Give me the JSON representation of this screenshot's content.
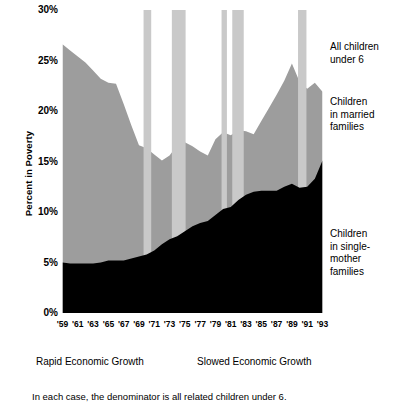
{
  "chart_data": {
    "type": "area",
    "title": "",
    "subtitle": "",
    "xlabel": "",
    "ylabel": "Percent in Poverty",
    "xlim": [
      1959,
      1993
    ],
    "ylim": [
      0,
      30
    ],
    "grid": false,
    "legend_position": "right-annotations",
    "y_ticks": [
      "30%",
      "25%",
      "20%",
      "15%",
      "10%",
      "5%",
      "0%"
    ],
    "y_tick_values": [
      30,
      25,
      20,
      15,
      10,
      5,
      0
    ],
    "x_ticks": [
      "'59",
      "'61",
      "'63",
      "'65",
      "'67",
      "'69",
      "'71",
      "'73",
      "'75",
      "'77",
      "'79",
      "'81",
      "'83",
      "'85",
      "'87",
      "'89",
      "'91",
      "'93"
    ],
    "x_tick_values": [
      1959,
      1961,
      1963,
      1965,
      1967,
      1969,
      1971,
      1973,
      1975,
      1977,
      1979,
      1981,
      1983,
      1985,
      1987,
      1989,
      1991,
      1993
    ],
    "x_minor_ticks": [
      1960,
      1962,
      1964,
      1966,
      1968,
      1970,
      1972,
      1974,
      1976,
      1978,
      1980,
      1982,
      1984,
      1986,
      1988,
      1990,
      1992
    ],
    "years": [
      1959,
      1960,
      1961,
      1962,
      1963,
      1964,
      1965,
      1966,
      1967,
      1968,
      1969,
      1970,
      1971,
      1972,
      1973,
      1974,
      1975,
      1976,
      1977,
      1978,
      1979,
      1980,
      1981,
      1982,
      1983,
      1984,
      1985,
      1986,
      1987,
      1988,
      1989,
      1990,
      1991,
      1992,
      1993
    ],
    "series": [
      {
        "name": "All children under 6",
        "stack_role": "total-upper-boundary",
        "fill": "#000000",
        "line_style": "thick-black",
        "values": [
          26.6,
          26.0,
          25.4,
          24.8,
          24.0,
          23.2,
          22.8,
          22.7,
          20.7,
          18.6,
          16.6,
          16.3,
          15.7,
          15.1,
          15.6,
          16.6,
          16.9,
          16.5,
          16.0,
          15.6,
          17.2,
          17.9,
          17.6,
          18.1,
          18.0,
          17.7,
          19.0,
          20.3,
          21.6,
          23.0,
          24.7,
          22.9,
          22.2,
          22.8,
          21.9
        ]
      },
      {
        "name": "Children in married families",
        "stack_role": "middle-band",
        "fill": "#9d9d9d",
        "values": [
          21.6,
          21.1,
          20.5,
          19.9,
          19.1,
          18.2,
          17.6,
          17.5,
          15.5,
          13.2,
          11.0,
          10.5,
          9.5,
          8.3,
          8.3,
          9.0,
          8.8,
          7.9,
          7.1,
          6.5,
          7.5,
          7.6,
          7.1,
          6.9,
          6.3,
          5.7,
          6.9,
          8.2,
          9.5,
          10.5,
          11.9,
          10.5,
          9.7,
          9.5,
          6.8
        ]
      },
      {
        "name": "Children in single-mother families",
        "stack_role": "bottom-band",
        "fill": "#000000",
        "values": [
          5.0,
          4.9,
          4.9,
          4.9,
          4.9,
          5.0,
          5.2,
          5.2,
          5.2,
          5.4,
          5.6,
          5.8,
          6.2,
          6.8,
          7.3,
          7.6,
          8.1,
          8.6,
          8.9,
          9.1,
          9.7,
          10.3,
          10.5,
          11.2,
          11.7,
          12.0,
          12.1,
          12.1,
          12.1,
          12.5,
          12.8,
          12.4,
          12.5,
          13.3,
          15.1
        ]
      }
    ],
    "recession_bands": [
      {
        "label": "1969-1970 recession",
        "start": 1969.6,
        "end": 1970.6,
        "color": "#c9c9c9"
      },
      {
        "label": "1973-1975 recession",
        "start": 1973.3,
        "end": 1975.1,
        "color": "#c9c9c9"
      },
      {
        "label": "1980 recession",
        "start": 1979.8,
        "end": 1980.5,
        "color": "#c9c9c9"
      },
      {
        "label": "1981-1982 recession",
        "start": 1981.2,
        "end": 1982.7,
        "color": "#c9c9c9"
      },
      {
        "label": "1990-1991 recession",
        "start": 1989.8,
        "end": 1990.9,
        "color": "#c9c9c9"
      }
    ],
    "annotations": [
      {
        "name": "all-children",
        "text": "All children\nunder 6"
      },
      {
        "name": "married-families",
        "text": "Children\nin married\nfamilies"
      },
      {
        "name": "single-mother-families",
        "text": "Children\nin single-\nmother\nfamilies"
      }
    ]
  },
  "axis": {
    "y_title": "Percent in Poverty"
  },
  "legend": {
    "all_children": "All children\nunder 6",
    "married": "Children\nin married\nfamilies",
    "single_mother": "Children\nin single-\nmother\nfamilies"
  },
  "eras": {
    "rapid": "Rapid Economic Growth",
    "slowed": "Slowed Economic Growth"
  },
  "footnote": "In each case, the denominator is all related children under 6.",
  "colors": {
    "ink": "#000000",
    "band_married": "#9d9d9d",
    "band_recession": "#c9c9c9",
    "background": "#ffffff"
  }
}
